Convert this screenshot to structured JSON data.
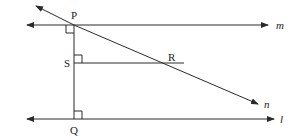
{
  "diagram": {
    "points": {
      "P": {
        "label": "P"
      },
      "S": {
        "label": "S"
      },
      "R": {
        "label": "R"
      },
      "Q": {
        "label": "Q"
      }
    },
    "lines": {
      "m": {
        "label": "m"
      },
      "n": {
        "label": "n"
      },
      "l": {
        "label": "l"
      }
    },
    "relations": [
      "PQ perpendicular to line m at P",
      "SR perpendicular to PQ at S",
      "PQ perpendicular to line l at Q",
      "line n passes through P and R"
    ]
  }
}
